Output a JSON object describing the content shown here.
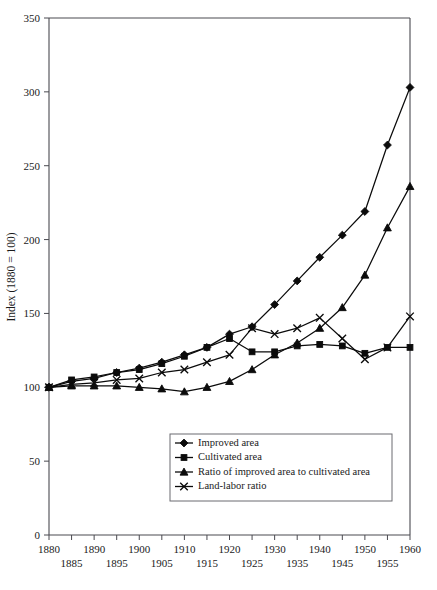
{
  "chart_data": {
    "type": "line",
    "title": "",
    "xlabel": "",
    "ylabel": "Index (1880 = 100)",
    "xlim": [
      1880,
      1960
    ],
    "ylim": [
      0,
      350
    ],
    "grid": false,
    "legend_position": "lower-center",
    "x": [
      1880,
      1885,
      1890,
      1895,
      1900,
      1905,
      1910,
      1915,
      1920,
      1925,
      1930,
      1935,
      1940,
      1945,
      1950,
      1955,
      1960
    ],
    "y_ticks": [
      0,
      50,
      100,
      150,
      200,
      250,
      300,
      350
    ],
    "y_tick_labels": [
      "0",
      "50",
      "100",
      "150",
      "200",
      "250",
      "300",
      "350"
    ],
    "x_ticks": [
      1880,
      1885,
      1890,
      1895,
      1900,
      1905,
      1910,
      1915,
      1920,
      1925,
      1930,
      1935,
      1940,
      1945,
      1950,
      1955,
      1960
    ],
    "x_tick_labels_top": [
      "1880",
      "",
      "1890",
      "",
      "1900",
      "",
      "1910",
      "",
      "1920",
      "",
      "1930",
      "",
      "1940",
      "",
      "1950",
      "",
      "1960"
    ],
    "x_tick_labels_bottom": [
      "",
      "1885",
      "",
      "1895",
      "",
      "1905",
      "",
      "1915",
      "",
      "1925",
      "",
      "1935",
      "",
      "1945",
      "",
      "1955",
      ""
    ],
    "series": [
      {
        "name": "Improved area",
        "marker": "diamond",
        "values": [
          100,
          104,
          106,
          110,
          113,
          117,
          122,
          127,
          136,
          141,
          156,
          172,
          188,
          203,
          219,
          264,
          303
        ]
      },
      {
        "name": "Cultivated area",
        "marker": "square",
        "values": [
          100,
          105,
          107,
          110,
          112,
          116,
          121,
          127,
          133,
          124,
          124,
          128,
          129,
          128,
          123,
          127,
          127
        ]
      },
      {
        "name": "Ratio of improved area to cultivated area",
        "marker": "triangle",
        "values": [
          100,
          101,
          101,
          101,
          100,
          99,
          97,
          100,
          104,
          112,
          122,
          130,
          140,
          154,
          176,
          208,
          236
        ]
      },
      {
        "name": "Land-labor ratio",
        "marker": "x",
        "values": [
          100,
          102,
          103,
          105,
          106,
          110,
          112,
          117,
          122,
          140,
          136,
          140,
          147,
          133,
          119,
          127,
          148
        ]
      }
    ]
  },
  "legend": {
    "items": [
      {
        "label": "Improved area",
        "marker": "diamond"
      },
      {
        "label": "Cultivated area",
        "marker": "square"
      },
      {
        "label": "Ratio of improved area to cultivated area",
        "marker": "triangle"
      },
      {
        "label": "Land-labor ratio",
        "marker": "x"
      }
    ]
  }
}
